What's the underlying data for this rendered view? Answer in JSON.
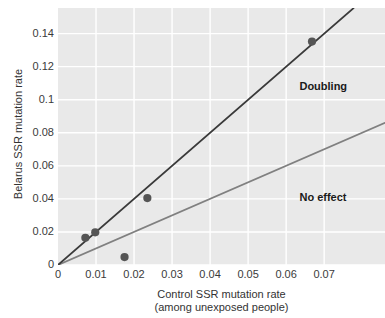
{
  "chart_data": {
    "type": "scatter",
    "title": "",
    "xlabel": "Control SSR mutation rate (among unexposed people)",
    "xlabel_line1": "Control SSR mutation rate",
    "xlabel_line2": "(among unexposed people)",
    "ylabel": "Belarus SSR mutation rate",
    "xlim": [
      0,
      0.086
    ],
    "ylim": [
      0,
      0.1555
    ],
    "xticks": [
      0,
      0.01,
      0.02,
      0.03,
      0.04,
      0.05,
      0.06,
      0.07
    ],
    "xticklabels": [
      "0",
      "0.01",
      "0.02",
      "0.03",
      "0.04",
      "0.05",
      "0.06",
      "0.07"
    ],
    "yticks": [
      0,
      0.02,
      0.04,
      0.06,
      0.08,
      0.1,
      0.12,
      0.14
    ],
    "yticklabels": [
      "0",
      "0.02",
      "0.04",
      "0.06",
      "0.08",
      "0.1",
      "0.12",
      "0.14"
    ],
    "grid": true,
    "grid_color": "#ffffff",
    "panel_background": "#e9e9e9",
    "legend_position": "inline-annotations",
    "points": [
      {
        "x": 0.0072,
        "y": 0.0165
      },
      {
        "x": 0.0098,
        "y": 0.0198
      },
      {
        "x": 0.0175,
        "y": 0.0048
      },
      {
        "x": 0.0235,
        "y": 0.0405
      },
      {
        "x": 0.0668,
        "y": 0.1352
      }
    ],
    "point_color": "#555555",
    "series": [
      {
        "name": "Doubling",
        "type": "line",
        "slope": 2,
        "intercept": 0,
        "color": "#3a3a3a",
        "label": "Doubling"
      },
      {
        "name": "No effect",
        "type": "line",
        "slope": 1,
        "intercept": 0,
        "color": "#808080",
        "label": "No effect"
      }
    ],
    "annotations": [
      {
        "text": "Doubling",
        "x": 0.0635,
        "y": 0.1075
      },
      {
        "text": "No effect",
        "x": 0.0635,
        "y": 0.0405
      }
    ]
  }
}
